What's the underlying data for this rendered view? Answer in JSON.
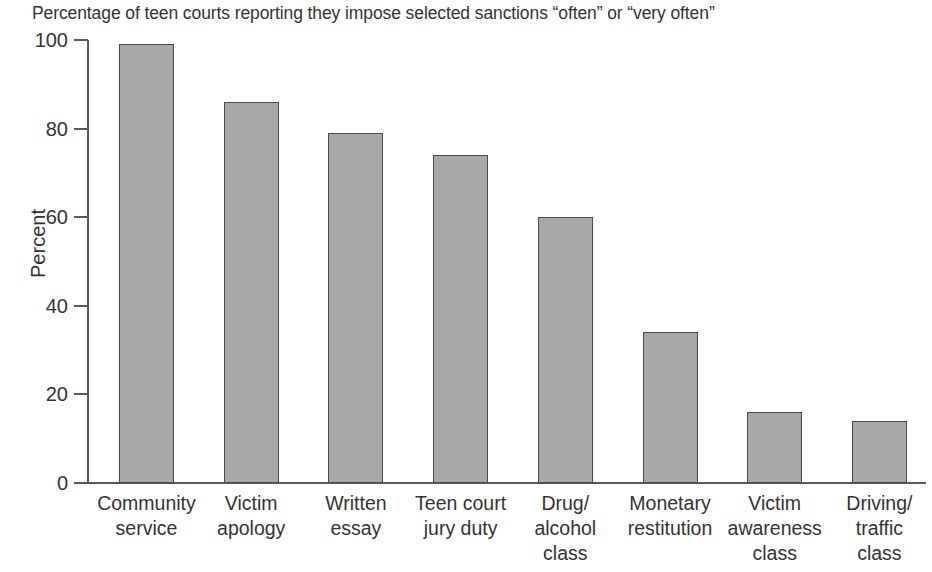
{
  "chart_data": {
    "type": "bar",
    "title": "Percentage of teen courts reporting they impose selected sanctions “often” or “very often”",
    "xlabel": "",
    "ylabel": "Percent",
    "ylim": [
      0,
      100
    ],
    "yticks": [
      0,
      20,
      40,
      60,
      80,
      100
    ],
    "grid": false,
    "legend": null,
    "bar_color": "#a8a8a8",
    "bar_edge_color": "#4a4a4a",
    "categories": [
      "Community\nservice",
      "Victim\napology",
      "Written\nessay",
      "Teen court\njury duty",
      "Drug/\nalcohol\nclass",
      "Monetary\nrestitution",
      "Victim\nawareness\nclass",
      "Driving/\ntraffic\nclass"
    ],
    "values": [
      99,
      86,
      79,
      74,
      60,
      34,
      16,
      14
    ]
  }
}
